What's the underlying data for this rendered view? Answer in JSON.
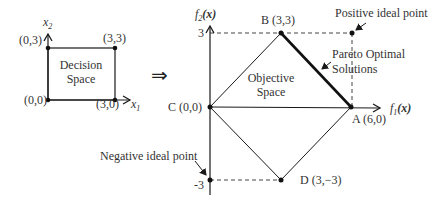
{
  "decision_space": {
    "axis_x_label": "x",
    "axis_x_sub": "1",
    "axis_y_label": "x",
    "axis_y_sub": "2",
    "title_line1": "Decision",
    "title_line2": "Space",
    "points": [
      {
        "label": "(0,0)"
      },
      {
        "label": "(0,3)"
      },
      {
        "label": "(3,3)"
      },
      {
        "label": "(3,0)"
      }
    ]
  },
  "arrow_symbol": "⇒",
  "objective_space": {
    "axis_x_label": "f",
    "axis_x_sub": "1",
    "axis_x_arg": "(x)",
    "axis_y_label": "f",
    "axis_y_sub": "2",
    "axis_y_arg": "(x)",
    "tick_top": "3",
    "tick_bottom": "-3",
    "title_line1": "Objective",
    "title_line2": "Space",
    "points": {
      "A": "A (6,0)",
      "B": "B (3,3)",
      "C": "C (0,0)",
      "D": "D (3,−3)"
    },
    "annotations": {
      "positive_ideal": "Positive ideal point",
      "negative_ideal": "Negative ideal point",
      "pareto_line1": "Pareto Optimal",
      "pareto_line2": "Solutions"
    }
  },
  "colors": {
    "line": "#1a1a1a",
    "text": "#333333",
    "dashed": "#444444"
  }
}
